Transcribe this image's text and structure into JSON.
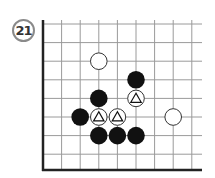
{
  "problem": {
    "number": "21"
  },
  "board": {
    "grid_origin": [
      43,
      24
    ],
    "spacing": 18.6,
    "cols": 9,
    "rows": 9,
    "visible_edges": [
      "left",
      "bottom"
    ],
    "line_color": "#9a9a9a",
    "edge_color": "#222222",
    "stones": [
      {
        "color": "white",
        "col": 3,
        "row": 2,
        "marker": null
      },
      {
        "color": "black",
        "col": 5,
        "row": 3,
        "marker": null
      },
      {
        "color": "black",
        "col": 3,
        "row": 4,
        "marker": null
      },
      {
        "color": "white",
        "col": 5,
        "row": 4,
        "marker": "triangle"
      },
      {
        "color": "black",
        "col": 2,
        "row": 5,
        "marker": null
      },
      {
        "color": "white",
        "col": 3,
        "row": 5,
        "marker": "triangle"
      },
      {
        "color": "white",
        "col": 4,
        "row": 5,
        "marker": "triangle"
      },
      {
        "color": "white",
        "col": 7,
        "row": 5,
        "marker": null
      },
      {
        "color": "black",
        "col": 3,
        "row": 6,
        "marker": null
      },
      {
        "color": "black",
        "col": 4,
        "row": 6,
        "marker": null
      },
      {
        "color": "black",
        "col": 5,
        "row": 6,
        "marker": null
      }
    ]
  }
}
